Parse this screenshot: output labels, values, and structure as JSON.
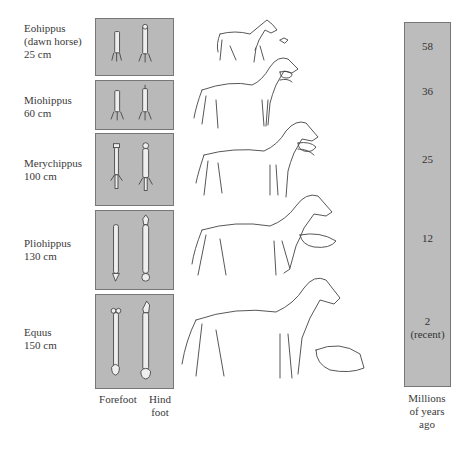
{
  "species": [
    {
      "name": "Eohippus",
      "name2": "(dawn horse)",
      "height": "25 cm",
      "mya": "58",
      "mya2": ""
    },
    {
      "name": "Miohippus",
      "name2": "",
      "height": "60 cm",
      "mya": "36",
      "mya2": ""
    },
    {
      "name": "Merychippus",
      "name2": "",
      "height": "100 cm",
      "mya": "25",
      "mya2": ""
    },
    {
      "name": "Pliohippus",
      "name2": "",
      "height": "130 cm",
      "mya": "12",
      "mya2": ""
    },
    {
      "name": "Equus",
      "name2": "",
      "height": "150 cm",
      "mya": "2",
      "mya2": "(recent)"
    }
  ],
  "columns": {
    "forefoot": "Forefoot",
    "hindfoot_1": "Hind",
    "hindfoot_2": "foot"
  },
  "timeline": {
    "label_1": "Millions",
    "label_2": "of years",
    "label_3": "ago"
  },
  "colors": {
    "panel_gray": "#b9b9b9",
    "line": "#444444"
  }
}
